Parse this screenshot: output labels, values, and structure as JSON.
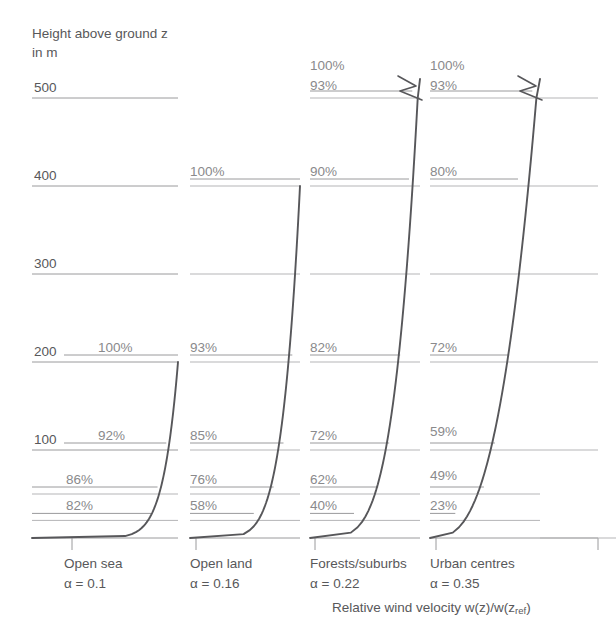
{
  "header": {
    "axis_title": "Height above ground z\nin m"
  },
  "y_axis": {
    "unit": "m",
    "ticks": [
      {
        "label": "500",
        "value": 500
      },
      {
        "label": "400",
        "value": 400
      },
      {
        "label": "300",
        "value": 300
      },
      {
        "label": "200",
        "value": 200
      },
      {
        "label": "100",
        "value": 100
      }
    ]
  },
  "caption": {
    "text_before": "Relative wind velocity w(z)/w(z",
    "subscript": "ref",
    "text_after": ")"
  },
  "colors": {
    "curve": "#57575a",
    "gridline": "#9a9a9c",
    "gridline_light": "#b5b5b7",
    "text": "#58585a",
    "pct_text": "#8a8a8c",
    "background": "#ffffff"
  },
  "chart_data": {
    "type": "line",
    "xlabel": "Relative wind velocity w(z)/w(z_ref)",
    "ylabel": "Height above ground z in m",
    "ylim": [
      0,
      520
    ],
    "grid": true,
    "legend": "none",
    "note": "Power-law wind profiles w(z)/w(z_ref) = (z/z_ref)^alpha. Each column is an independent sub-plot with its own baseline; axis is broken (zigzag) above the profile top for columns 3 and 4.",
    "series": [
      {
        "name": "Open sea",
        "alpha": 0.1,
        "alpha_label": "α = 0.1",
        "gradient_height": 200,
        "points": [
          {
            "z": 200,
            "pct": 100,
            "label": "100%"
          },
          {
            "z": 100,
            "pct": 92,
            "label": "92%"
          },
          {
            "z": 50,
            "pct": 86,
            "label": "86%"
          },
          {
            "z": 20,
            "pct": 82,
            "label": "82%"
          },
          {
            "z": 0,
            "pct": 0,
            "label": ""
          }
        ]
      },
      {
        "name": "Open land",
        "alpha": 0.16,
        "alpha_label": "α = 0.16",
        "gradient_height": 400,
        "points": [
          {
            "z": 400,
            "pct": 100,
            "label": "100%"
          },
          {
            "z": 200,
            "pct": 93,
            "label": "93%"
          },
          {
            "z": 100,
            "pct": 85,
            "label": "85%"
          },
          {
            "z": 50,
            "pct": 76,
            "label": "76%"
          },
          {
            "z": 20,
            "pct": 58,
            "label": "58%"
          },
          {
            "z": 0,
            "pct": 0,
            "label": ""
          }
        ]
      },
      {
        "name": "Forests/suburbs",
        "alpha": 0.22,
        "alpha_label": "α = 0.22",
        "gradient_height": 550,
        "broken_axis": true,
        "points": [
          {
            "z": 550,
            "pct": 100,
            "label": "100%"
          },
          {
            "z": 500,
            "pct": 93,
            "label": "93%"
          },
          {
            "z": 400,
            "pct": 90,
            "label": "90%"
          },
          {
            "z": 200,
            "pct": 82,
            "label": "82%"
          },
          {
            "z": 100,
            "pct": 72,
            "label": "72%"
          },
          {
            "z": 50,
            "pct": 62,
            "label": "62%"
          },
          {
            "z": 20,
            "pct": 40,
            "label": "40%"
          },
          {
            "z": 0,
            "pct": 0,
            "label": ""
          }
        ]
      },
      {
        "name": "Urban centres",
        "alpha": 0.35,
        "alpha_label": "α = 0.35",
        "gradient_height": 550,
        "broken_axis": true,
        "points": [
          {
            "z": 550,
            "pct": 100,
            "label": "100%"
          },
          {
            "z": 500,
            "pct": 93,
            "label": "93%"
          },
          {
            "z": 400,
            "pct": 80,
            "label": "80%"
          },
          {
            "z": 200,
            "pct": 72,
            "label": "72%"
          },
          {
            "z": 100,
            "pct": 59,
            "label": "59%"
          },
          {
            "z": 50,
            "pct": 49,
            "label": "49%"
          },
          {
            "z": 20,
            "pct": 23,
            "label": "23%"
          },
          {
            "z": 0,
            "pct": 0,
            "label": ""
          }
        ]
      }
    ]
  }
}
